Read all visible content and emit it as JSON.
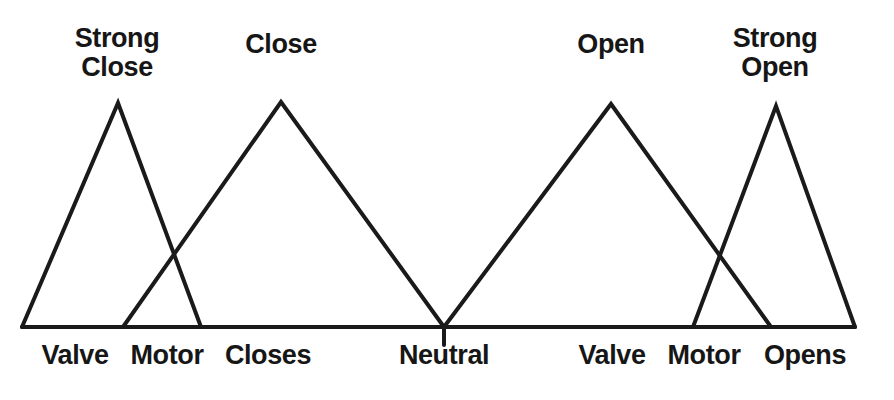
{
  "figure": {
    "background_color": "#ffffff",
    "line_color": "#1a1a1a",
    "width": 894,
    "height": 400
  },
  "set_labels": [
    {
      "id": "strong-close",
      "text": "Strong\nClose",
      "x": 117,
      "y": 24
    },
    {
      "id": "close",
      "text": "Close",
      "x": 281,
      "y": 30
    },
    {
      "id": "open",
      "text": "Open",
      "x": 611,
      "y": 30
    },
    {
      "id": "strong-open",
      "text": "Strong\nOpen",
      "x": 775,
      "y": 24
    }
  ],
  "axis_labels": [
    {
      "id": "valve-left",
      "text": "Valve",
      "x": 75,
      "y": 340
    },
    {
      "id": "motor-left",
      "text": "Motor",
      "x": 167,
      "y": 340
    },
    {
      "id": "closes",
      "text": "Closes",
      "x": 268,
      "y": 340
    },
    {
      "id": "neutral",
      "text": "Neutral",
      "x": 444,
      "y": 340
    },
    {
      "id": "valve-right",
      "text": "Valve",
      "x": 612,
      "y": 340
    },
    {
      "id": "motor-right",
      "text": "Motor",
      "x": 704,
      "y": 340
    },
    {
      "id": "opens",
      "text": "Opens",
      "x": 805,
      "y": 340
    }
  ],
  "chart_data": {
    "type": "line",
    "xlabel": "",
    "ylabel": "",
    "xlim": [
      22,
      855
    ],
    "ylim": [
      0,
      1
    ],
    "grid": false,
    "legend": "none",
    "baseline_y_px": 327,
    "axis": {
      "x_start_px": 22,
      "x_end_px": 855,
      "neutral_tick_x_px": 444,
      "neutral_tick_bottom_px": 345
    },
    "series": [
      {
        "name": "Strong Close",
        "shape": "triangle",
        "left_px": 22,
        "peak_px": 118,
        "right_px": 201,
        "peak_y_px": 103,
        "values": [
          0,
          1,
          0
        ]
      },
      {
        "name": "Close",
        "shape": "triangle",
        "left_px": 123,
        "peak_px": 281,
        "right_px": 444,
        "peak_y_px": 102,
        "values": [
          0,
          1,
          0
        ]
      },
      {
        "name": "Open",
        "shape": "triangle",
        "left_px": 444,
        "peak_px": 611,
        "right_px": 771,
        "peak_y_px": 104,
        "values": [
          0,
          1,
          0
        ]
      },
      {
        "name": "Strong Open",
        "shape": "triangle",
        "left_px": 693,
        "peak_px": 776,
        "right_px": 855,
        "peak_y_px": 106,
        "values": [
          0,
          1,
          0
        ]
      }
    ],
    "annotations": [
      "Valve",
      "Motor",
      "Closes",
      "Neutral",
      "Valve",
      "Motor",
      "Opens"
    ]
  }
}
